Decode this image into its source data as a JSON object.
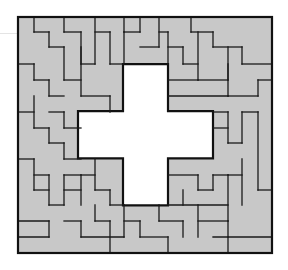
{
  "puzzle": {
    "type": "polyomino-tiling",
    "grid": {
      "cols": 17,
      "rows": 15
    },
    "origin_px": [
      18,
      17
    ],
    "cell_px": [
      15.0,
      15.7
    ],
    "hole_shape": "cross",
    "hole_cells": {
      "vertical_arm": {
        "col_start": 7,
        "col_end": 10,
        "row_start": 3,
        "row_end": 12
      },
      "horizontal_arm": {
        "col_start": 4,
        "col_end": 13,
        "row_start": 6,
        "row_end": 9
      }
    },
    "colors": {
      "fill": "#c8c8c8",
      "line": "#1a1a1a",
      "hole": "#ffffff",
      "background": "#ffffff"
    }
  },
  "segments": [
    [
      34,
      17,
      34,
      32
    ],
    [
      34,
      32,
      49,
      32
    ],
    [
      49,
      32,
      49,
      47
    ],
    [
      49,
      47,
      64,
      47
    ],
    [
      64,
      47,
      64,
      80
    ],
    [
      64,
      80,
      81,
      80
    ],
    [
      18,
      64,
      34,
      64
    ],
    [
      34,
      64,
      34,
      80
    ],
    [
      34,
      80,
      49,
      80
    ],
    [
      49,
      80,
      49,
      96
    ],
    [
      49,
      96,
      64,
      96
    ],
    [
      64,
      17,
      64,
      32
    ],
    [
      64,
      32,
      81,
      32
    ],
    [
      81,
      32,
      81,
      64
    ],
    [
      81,
      64,
      95,
      64
    ],
    [
      95,
      64,
      95,
      17
    ],
    [
      81,
      47,
      81,
      96
    ],
    [
      81,
      96,
      110,
      96
    ],
    [
      110,
      96,
      110,
      112
    ],
    [
      110,
      32,
      95,
      32
    ],
    [
      110,
      32,
      110,
      64
    ],
    [
      110,
      64,
      124,
      64
    ],
    [
      124,
      64,
      124,
      32
    ],
    [
      124,
      32,
      140,
      32
    ],
    [
      124,
      17,
      124,
      32
    ],
    [
      140,
      17,
      140,
      32
    ],
    [
      140,
      47,
      159,
      47
    ],
    [
      159,
      47,
      159,
      17
    ],
    [
      159,
      32,
      168,
      32
    ],
    [
      168,
      32,
      168,
      64
    ],
    [
      168,
      47,
      183,
      47
    ],
    [
      183,
      47,
      183,
      64
    ],
    [
      183,
      64,
      198,
      64
    ],
    [
      191,
      17,
      191,
      32
    ],
    [
      191,
      32,
      213,
      32
    ],
    [
      213,
      32,
      213,
      47
    ],
    [
      213,
      47,
      242,
      47
    ],
    [
      198,
      32,
      198,
      80
    ],
    [
      198,
      80,
      228,
      80
    ],
    [
      228,
      80,
      228,
      47
    ],
    [
      242,
      47,
      242,
      64
    ],
    [
      242,
      64,
      272,
      64
    ],
    [
      228,
      64,
      228,
      96
    ],
    [
      228,
      96,
      258,
      96
    ],
    [
      258,
      96,
      258,
      80
    ],
    [
      258,
      80,
      272,
      80
    ],
    [
      168,
      80,
      198,
      80
    ],
    [
      168,
      96,
      228,
      96
    ],
    [
      213,
      112,
      228,
      112
    ],
    [
      228,
      112,
      228,
      143
    ],
    [
      228,
      143,
      242,
      143
    ],
    [
      242,
      143,
      242,
      112
    ],
    [
      242,
      112,
      258,
      112
    ],
    [
      258,
      112,
      258,
      190
    ],
    [
      258,
      190,
      272,
      190
    ],
    [
      213,
      128,
      228,
      128
    ],
    [
      242,
      159,
      242,
      205
    ],
    [
      228,
      175,
      242,
      175
    ],
    [
      228,
      175,
      228,
      221
    ],
    [
      168,
      175,
      198,
      175
    ],
    [
      198,
      175,
      198,
      190
    ],
    [
      198,
      190,
      213,
      190
    ],
    [
      213,
      190,
      213,
      175
    ],
    [
      213,
      175,
      228,
      175
    ],
    [
      183,
      190,
      183,
      205
    ],
    [
      168,
      205,
      228,
      205
    ],
    [
      198,
      205,
      198,
      237
    ],
    [
      198,
      221,
      228,
      221
    ],
    [
      228,
      221,
      228,
      237
    ],
    [
      213,
      237,
      272,
      237
    ],
    [
      228,
      237,
      228,
      253
    ],
    [
      124,
      205,
      124,
      237
    ],
    [
      124,
      221,
      140,
      221
    ],
    [
      140,
      221,
      140,
      237
    ],
    [
      140,
      237,
      168,
      237
    ],
    [
      168,
      237,
      168,
      253
    ],
    [
      159,
      205,
      159,
      221
    ],
    [
      159,
      221,
      183,
      221
    ],
    [
      183,
      221,
      183,
      237
    ],
    [
      95,
      205,
      95,
      221
    ],
    [
      95,
      221,
      110,
      221
    ],
    [
      110,
      221,
      110,
      253
    ],
    [
      64,
      221,
      81,
      221
    ],
    [
      81,
      221,
      81,
      237
    ],
    [
      81,
      237,
      124,
      237
    ],
    [
      18,
      221,
      49,
      221
    ],
    [
      49,
      221,
      49,
      237
    ],
    [
      49,
      237,
      18,
      237
    ],
    [
      34,
      175,
      49,
      175
    ],
    [
      49,
      175,
      49,
      205
    ],
    [
      49,
      205,
      64,
      205
    ],
    [
      64,
      205,
      64,
      175
    ],
    [
      64,
      175,
      81,
      175
    ],
    [
      81,
      175,
      81,
      205
    ],
    [
      18,
      159,
      34,
      159
    ],
    [
      34,
      159,
      34,
      190
    ],
    [
      34,
      190,
      49,
      190
    ],
    [
      34,
      128,
      49,
      128
    ],
    [
      49,
      128,
      49,
      143
    ],
    [
      49,
      143,
      64,
      143
    ],
    [
      64,
      143,
      64,
      159
    ],
    [
      64,
      159,
      81,
      159
    ],
    [
      34,
      96,
      34,
      128
    ],
    [
      18,
      112,
      34,
      112
    ],
    [
      49,
      112,
      64,
      112
    ],
    [
      64,
      112,
      64,
      128
    ],
    [
      64,
      128,
      81,
      128
    ],
    [
      95,
      159,
      95,
      190
    ],
    [
      95,
      190,
      110,
      190
    ],
    [
      110,
      190,
      110,
      205
    ],
    [
      110,
      205,
      124,
      205
    ],
    [
      81,
      175,
      95,
      175
    ],
    [
      64,
      190,
      81,
      190
    ]
  ]
}
